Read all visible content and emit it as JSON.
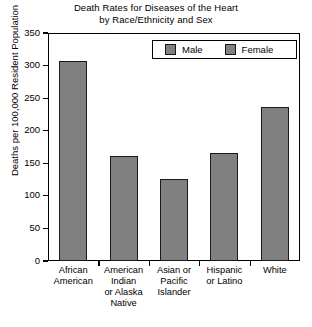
{
  "chart_data": {
    "type": "bar",
    "subtype": "stacked-bar",
    "title": "Death Rates for Diseases of the Heart\nby Race/Ethnicity and Sex",
    "title_line1": "Death Rates for Diseases of the Heart",
    "title_line2": "by Race/Ethnicity and Sex",
    "xlabel": "",
    "ylabel": "Deaths per 100,000 Resident Population",
    "ylim": [
      0,
      350
    ],
    "ytick_values": [
      0,
      50,
      100,
      150,
      200,
      250,
      300,
      350
    ],
    "ytick_labels": [
      "0",
      "50",
      "100",
      "150",
      "200",
      "250",
      "300",
      "350"
    ],
    "grid": false,
    "legend_position": "top-right",
    "categories": [
      "African American",
      "American Indian or Alaska Native",
      "Asian or Pacific Islander",
      "Hispanic or Latino",
      "White"
    ],
    "category_label_lines": [
      [
        "African",
        "American"
      ],
      [
        "American",
        "Indian",
        "or Alaska",
        "Native"
      ],
      [
        "Asian or",
        "Pacific",
        "Islander"
      ],
      [
        "Hispanic",
        "or Latino"
      ],
      [
        "White"
      ]
    ],
    "series": [
      {
        "name": "Female",
        "color": "#808080",
        "stack_position": "bottom",
        "values": [
          205,
          100,
          82,
          112,
          151
        ]
      },
      {
        "name": "Male",
        "color": "#808080",
        "stack_position": "top",
        "values": [
          102,
          61,
          44,
          54,
          85
        ]
      }
    ],
    "totals": [
      307,
      161,
      126,
      166,
      236
    ],
    "colors": {
      "bar_fill": "#808080",
      "bar_edge": "#1a1a1a",
      "axis": "#000000",
      "background": "#ffffff"
    }
  },
  "legend": {
    "items": [
      {
        "label": "Male",
        "swatch": "#808080"
      },
      {
        "label": "Female",
        "swatch": "#808080"
      }
    ]
  }
}
